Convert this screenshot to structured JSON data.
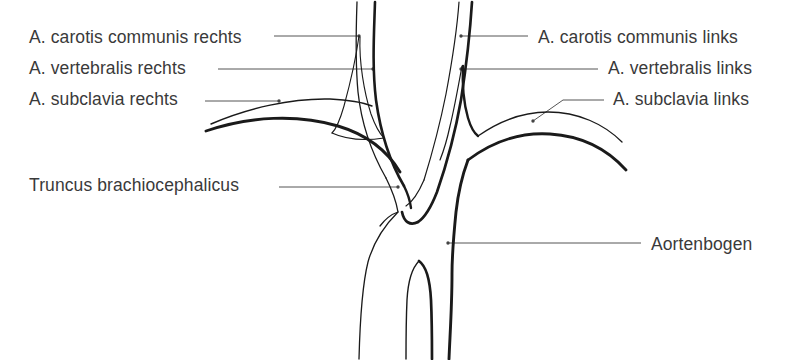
{
  "figure": {
    "language": "de",
    "background_color": "#ffffff",
    "ink_color": "#1a1a1a",
    "text_color": "#3a3a3a"
  },
  "labels": {
    "carotis_rechts": "A. carotis communis rechts",
    "vertebralis_rechts": "A. vertebralis rechts",
    "subclavia_rechts": "A. subclavia rechts",
    "truncus": "Truncus brachiocephalicus",
    "carotis_links": "A. carotis communis links",
    "vertebralis_links": "A. vertebralis links",
    "subclavia_links": "A. subclavia links",
    "aortenbogen": "Aortenbogen"
  },
  "structures": [
    {
      "name": "a-carotis-communis-rechts",
      "side": "right",
      "label_ref": "carotis_rechts"
    },
    {
      "name": "a-vertebralis-rechts",
      "side": "right",
      "label_ref": "vertebralis_rechts"
    },
    {
      "name": "a-subclavia-rechts",
      "side": "right",
      "label_ref": "subclavia_rechts"
    },
    {
      "name": "truncus-brachiocephalicus",
      "side": "right",
      "label_ref": "truncus"
    },
    {
      "name": "a-carotis-communis-links",
      "side": "left",
      "label_ref": "carotis_links"
    },
    {
      "name": "a-vertebralis-links",
      "side": "left",
      "label_ref": "vertebralis_links"
    },
    {
      "name": "a-subclavia-links",
      "side": "left",
      "label_ref": "subclavia_links"
    },
    {
      "name": "aortenbogen",
      "side": "center",
      "label_ref": "aortenbogen"
    }
  ]
}
